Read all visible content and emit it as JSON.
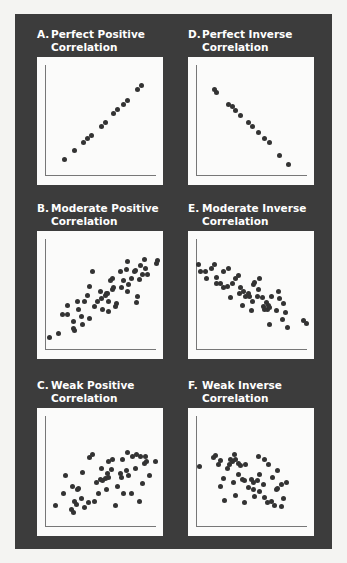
{
  "colors": {
    "frame": "#3c3c3c",
    "plot_bg": "#fbfbfa",
    "dot": "#333333",
    "title": "#ffffff",
    "axis": "#777777"
  },
  "panels": [
    {
      "id": "A",
      "letter": "A.",
      "line1": "Perfect Positive",
      "line2": "Correlation"
    },
    {
      "id": "D",
      "letter": "D.",
      "line1": "Perfect Inverse",
      "line2": "Correlation"
    },
    {
      "id": "B",
      "letter": "B.",
      "line1": "Moderate Positive",
      "line2": "Correlation"
    },
    {
      "id": "E",
      "letter": "E.",
      "line1": "Moderate Inverse",
      "line2": "Correlation"
    },
    {
      "id": "C",
      "letter": "C.",
      "line1": "Weak Positive",
      "line2": "Correlation"
    },
    {
      "id": "F",
      "letter": "F.",
      "line1": "Weak Inverse",
      "line2": "Correlation"
    }
  ],
  "chart_data": [
    {
      "type": "scatter",
      "title": "A. Perfect Positive Correlation",
      "xlabel": "",
      "ylabel": "",
      "grid": false,
      "points": [
        [
          22,
          80
        ],
        [
          30,
          73
        ],
        [
          37,
          67
        ],
        [
          40,
          64
        ],
        [
          43,
          61
        ],
        [
          51,
          54
        ],
        [
          54,
          51
        ],
        [
          61,
          44
        ],
        [
          64,
          41
        ],
        [
          69,
          37
        ],
        [
          72,
          34
        ],
        [
          80,
          25
        ],
        [
          83,
          22
        ]
      ]
    },
    {
      "type": "scatter",
      "title": "D. Perfect Inverse Correlation",
      "xlabel": "",
      "ylabel": "",
      "grid": false,
      "points": [
        [
          21,
          25
        ],
        [
          23,
          28
        ],
        [
          32,
          37
        ],
        [
          35,
          39
        ],
        [
          38,
          42
        ],
        [
          42,
          46
        ],
        [
          48,
          51
        ],
        [
          51,
          54
        ],
        [
          56,
          59
        ],
        [
          61,
          64
        ],
        [
          65,
          67
        ],
        [
          73,
          77
        ],
        [
          80,
          84
        ]
      ]
    },
    {
      "type": "scatter",
      "title": "B. Moderate Positive Correlation",
      "xlabel": "",
      "ylabel": "",
      "grid": false,
      "points": [
        [
          10,
          83
        ],
        [
          17,
          80
        ],
        [
          20,
          65
        ],
        [
          24,
          65
        ],
        [
          24,
          58
        ],
        [
          29,
          71
        ],
        [
          29,
          76
        ],
        [
          30,
          78
        ],
        [
          32,
          55
        ],
        [
          33,
          61
        ],
        [
          35,
          67
        ],
        [
          36,
          73
        ],
        [
          38,
          55
        ],
        [
          40,
          50
        ],
        [
          42,
          68
        ],
        [
          42,
          43
        ],
        [
          44,
          32
        ],
        [
          46,
          59
        ],
        [
          48,
          55
        ],
        [
          50,
          47
        ],
        [
          51,
          53
        ],
        [
          52,
          61
        ],
        [
          54,
          50
        ],
        [
          55,
          49
        ],
        [
          56,
          49
        ],
        [
          57,
          63
        ],
        [
          57,
          55
        ],
        [
          58,
          39
        ],
        [
          60,
          37
        ],
        [
          60,
          46
        ],
        [
          61,
          44
        ],
        [
          62,
          59
        ],
        [
          63,
          57
        ],
        [
          66,
          32
        ],
        [
          67,
          44
        ],
        [
          69,
          39
        ],
        [
          71,
          30
        ],
        [
          72,
          47
        ],
        [
          72,
          24
        ],
        [
          73,
          42
        ],
        [
          75,
          37
        ],
        [
          77,
          32
        ],
        [
          78,
          31
        ],
        [
          79,
          56
        ],
        [
          80,
          51
        ],
        [
          81,
          38
        ],
        [
          82,
          27
        ],
        [
          84,
          34
        ],
        [
          85,
          22
        ],
        [
          86,
          29
        ],
        [
          88,
          34
        ],
        [
          95,
          25
        ],
        [
          96,
          23
        ]
      ]
    },
    {
      "type": "scatter",
      "title": "E. Moderate Inverse Correlation",
      "xlabel": "",
      "ylabel": "",
      "grid": false,
      "points": [
        [
          8,
          26
        ],
        [
          10,
          32
        ],
        [
          14,
          32
        ],
        [
          15,
          37
        ],
        [
          19,
          29
        ],
        [
          21,
          26
        ],
        [
          23,
          41
        ],
        [
          23,
          36
        ],
        [
          26,
          41
        ],
        [
          28,
          44
        ],
        [
          28,
          32
        ],
        [
          31,
          43
        ],
        [
          32,
          29
        ],
        [
          34,
          52
        ],
        [
          35,
          41
        ],
        [
          38,
          37
        ],
        [
          40,
          35
        ],
        [
          41,
          49
        ],
        [
          42,
          44
        ],
        [
          43,
          58
        ],
        [
          44,
          47
        ],
        [
          46,
          51
        ],
        [
          48,
          49
        ],
        [
          49,
          51
        ],
        [
          50,
          62
        ],
        [
          51,
          55
        ],
        [
          52,
          42
        ],
        [
          53,
          40
        ],
        [
          55,
          51
        ],
        [
          56,
          46
        ],
        [
          57,
          37
        ],
        [
          59,
          52
        ],
        [
          60,
          59
        ],
        [
          61,
          61
        ],
        [
          62,
          56
        ],
        [
          63,
          61
        ],
        [
          64,
          58
        ],
        [
          65,
          60
        ],
        [
          65,
          73
        ],
        [
          66,
          51
        ],
        [
          70,
          62
        ],
        [
          72,
          47
        ],
        [
          73,
          53
        ],
        [
          75,
          69
        ],
        [
          76,
          57
        ],
        [
          77,
          64
        ],
        [
          79,
          75
        ],
        [
          92,
          70
        ],
        [
          94,
          72
        ]
      ]
    },
    {
      "type": "scatter",
      "title": "C. Weak Positive Correlation",
      "xlabel": "",
      "ylabel": "",
      "grid": false,
      "points": [
        [
          15,
          76
        ],
        [
          21,
          67
        ],
        [
          23,
          53
        ],
        [
          27,
          79
        ],
        [
          29,
          82
        ],
        [
          28,
          61
        ],
        [
          30,
          73
        ],
        [
          31,
          75
        ],
        [
          32,
          64
        ],
        [
          33,
          63
        ],
        [
          35,
          71
        ],
        [
          36,
          50
        ],
        [
          38,
          78
        ],
        [
          41,
          74
        ],
        [
          42,
          39
        ],
        [
          44,
          36
        ],
        [
          46,
          73
        ],
        [
          47,
          58
        ],
        [
          49,
          67
        ],
        [
          50,
          56
        ],
        [
          51,
          47
        ],
        [
          52,
          57
        ],
        [
          54,
          55
        ],
        [
          55,
          64
        ],
        [
          56,
          51
        ],
        [
          57,
          54
        ],
        [
          57,
          42
        ],
        [
          59,
          48
        ],
        [
          60,
          40
        ],
        [
          62,
          76
        ],
        [
          64,
          61
        ],
        [
          66,
          51
        ],
        [
          67,
          54
        ],
        [
          68,
          40
        ],
        [
          69,
          67
        ],
        [
          71,
          49
        ],
        [
          72,
          35
        ],
        [
          73,
          53
        ],
        [
          75,
          67
        ],
        [
          76,
          38
        ],
        [
          78,
          47
        ],
        [
          79,
          36
        ],
        [
          81,
          73
        ],
        [
          82,
          38
        ],
        [
          84,
          59
        ],
        [
          85,
          43
        ],
        [
          86,
          38
        ],
        [
          87,
          42
        ],
        [
          89,
          53
        ],
        [
          94,
          42
        ]
      ]
    },
    {
      "type": "scatter",
      "title": "F. Weak Inverse Correlation",
      "xlabel": "",
      "ylabel": "",
      "grid": false,
      "points": [
        [
          9,
          46
        ],
        [
          20,
          39
        ],
        [
          22,
          37
        ],
        [
          24,
          44
        ],
        [
          26,
          41
        ],
        [
          26,
          61
        ],
        [
          28,
          55
        ],
        [
          29,
          72
        ],
        [
          31,
          47
        ],
        [
          33,
          44
        ],
        [
          34,
          40
        ],
        [
          35,
          42
        ],
        [
          36,
          58
        ],
        [
          37,
          36
        ],
        [
          38,
          68
        ],
        [
          38,
          40
        ],
        [
          40,
          52
        ],
        [
          40,
          43
        ],
        [
          42,
          45
        ],
        [
          43,
          56
        ],
        [
          45,
          57
        ],
        [
          45,
          74
        ],
        [
          46,
          44
        ],
        [
          48,
          62
        ],
        [
          50,
          56
        ],
        [
          52,
          58
        ],
        [
          52,
          64
        ],
        [
          53,
          69
        ],
        [
          55,
          57
        ],
        [
          56,
          38
        ],
        [
          57,
          52
        ],
        [
          57,
          65
        ],
        [
          60,
          60
        ],
        [
          61,
          40
        ],
        [
          61,
          70
        ],
        [
          63,
          74
        ],
        [
          64,
          44
        ],
        [
          66,
          73
        ],
        [
          67,
          54
        ],
        [
          69,
          76
        ],
        [
          70,
          64
        ],
        [
          71,
          63
        ],
        [
          71,
          49
        ],
        [
          74,
          60
        ],
        [
          74,
          77
        ],
        [
          76,
          71
        ],
        [
          78,
          58
        ]
      ]
    }
  ]
}
